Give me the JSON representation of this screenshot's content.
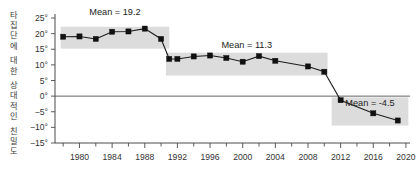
{
  "chart_data": {
    "type": "line",
    "title": "",
    "subtitle": "",
    "xlabel": "",
    "ylabel": "타집단에 대한 상대적인 친밀도",
    "ylabel_chars": [
      "타",
      "집",
      "단",
      "에",
      "대",
      "한",
      "상",
      "대",
      "적",
      "인",
      "친",
      "밀",
      "도"
    ],
    "xlim": [
      1977,
      2020.5
    ],
    "ylim": [
      -15,
      25
    ],
    "y_ticks": [
      25,
      20,
      15,
      10,
      5,
      0,
      -5,
      -10,
      -15
    ],
    "y_tick_labels": [
      "25°",
      "20°",
      "15°",
      "10°",
      "5°",
      "0°",
      "−5°",
      "−10°",
      "−15°"
    ],
    "x_ticks": [
      1980,
      1984,
      1988,
      1992,
      1996,
      2000,
      2004,
      2008,
      2012,
      2016,
      2020
    ],
    "x_tick_labels": [
      "1980",
      "1984",
      "1988",
      "1992",
      "1996",
      "2000",
      "2004",
      "2008",
      "2012",
      "2016",
      "2020"
    ],
    "x_minor_tick_step": 2,
    "grid": false,
    "legend": "none",
    "zero_reference_line": 0,
    "series": [
      {
        "name": "relative warmth",
        "x": [
          1978,
          1980,
          1982,
          1984,
          1986,
          1988,
          1990,
          1991,
          1992,
          1994,
          1996,
          1998,
          2000,
          2002,
          2004,
          2008,
          2010,
          2012,
          2016,
          2019
        ],
        "values": [
          19.0,
          19.1,
          18.3,
          20.6,
          20.7,
          21.6,
          18.3,
          11.9,
          11.9,
          12.7,
          13.0,
          12.2,
          11.0,
          12.8,
          11.3,
          9.5,
          7.8,
          -1.3,
          -5.5,
          -7.8
        ]
      }
    ],
    "bands": [
      {
        "label": "Mean = 19.2",
        "mean": 19.2,
        "x_start": 1977.7,
        "x_end": 1991.0,
        "y_top": 22.2,
        "y_bottom": 15.2
      },
      {
        "label": "Mean = 11.3",
        "mean": 11.3,
        "x_start": 1990.6,
        "x_end": 2010.4,
        "y_top": 13.9,
        "y_bottom": 6.6
      },
      {
        "label": "Mean = -4.5",
        "mean": -4.5,
        "x_start": 2010.9,
        "x_end": 2020.3,
        "y_top": -0.4,
        "y_bottom": -9.4
      }
    ],
    "colors": {
      "band_fill": "#d6d6d6",
      "line": "#1c1c1c",
      "marker": "#111111",
      "axis": "#4a4a4a",
      "background": "#ffffff"
    }
  }
}
